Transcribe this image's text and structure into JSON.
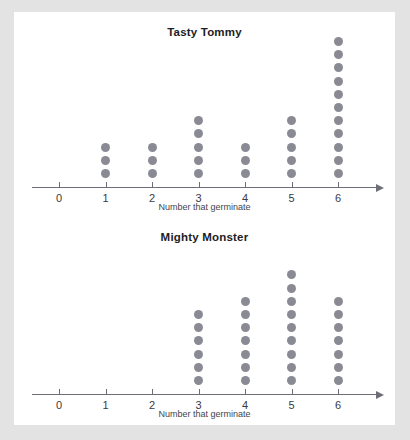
{
  "page": {
    "background_color": "#e3e3e3",
    "card_color": "#ffffff"
  },
  "style": {
    "dot_color": "#8a8a94",
    "axis_color": "#6e6e78",
    "title_color": "#1d1d24",
    "label_color": "#3a3a42"
  },
  "chart_data": [
    {
      "type": "dot-plot",
      "title": "Tasty Tommy",
      "xlabel": "Number that germinate",
      "ylabel": "",
      "categories": [
        "0",
        "1",
        "2",
        "3",
        "4",
        "5",
        "6"
      ],
      "values": [
        0,
        3,
        3,
        5,
        3,
        5,
        11
      ],
      "xlim": [
        0,
        6
      ],
      "grid": false,
      "legend": "none"
    },
    {
      "type": "dot-plot",
      "title": "Mighty Monster",
      "xlabel": "Number that germinate",
      "ylabel": "",
      "categories": [
        "0",
        "1",
        "2",
        "3",
        "4",
        "5",
        "6"
      ],
      "values": [
        0,
        0,
        0,
        6,
        7,
        9,
        7
      ],
      "xlim": [
        0,
        6
      ],
      "grid": false,
      "legend": "none"
    }
  ]
}
